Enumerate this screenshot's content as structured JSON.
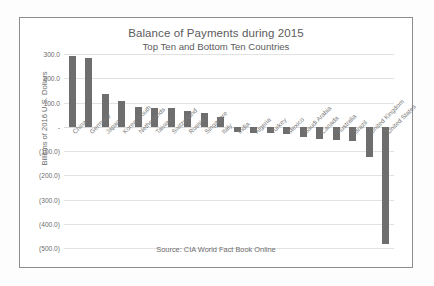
{
  "chart_data": {
    "type": "bar",
    "title": "Balance of Payments during 2015",
    "subtitle": "Top Ten and Bottom Ten Countries",
    "xlabel": "",
    "ylabel": "Billions of 2016 U.S. Dollars",
    "ylim": [
      -500,
      300
    ],
    "grid": true,
    "legend": false,
    "source": "Source: CIA World  Fact Book Online",
    "ytick_labels": [
      "300.0",
      "200.0",
      "100.0",
      "-",
      "(100.0)",
      "(200.0)",
      "(300.0)",
      "(400.0)",
      "(500.0)"
    ],
    "ytick_values": [
      300,
      200,
      100,
      0,
      -100,
      -200,
      -300,
      -400,
      -500
    ],
    "categories": [
      "China",
      "Germany",
      "Japan",
      "Korea_South",
      "Netherlands",
      "Taiwan",
      "Switzerland",
      "Russia",
      "Singapore",
      "Italy",
      "India",
      "Algeria",
      "Turkey",
      "Mexico",
      "Saudi Arabia",
      "Canada",
      "Australia",
      "Brazil",
      "United Kingdom",
      "United States"
    ],
    "values": [
      293.0,
      285.0,
      135.0,
      106.0,
      82.0,
      76.0,
      76.0,
      66.0,
      58.0,
      40.0,
      -22.0,
      -25.0,
      -27.0,
      -29.0,
      -41.0,
      -50.0,
      -56.0,
      -59.0,
      -123.0,
      -484.0
    ],
    "bar_color": "#6e6e6e",
    "grid_color": "#e2e2e2",
    "border_color": "#8d8d8d"
  }
}
